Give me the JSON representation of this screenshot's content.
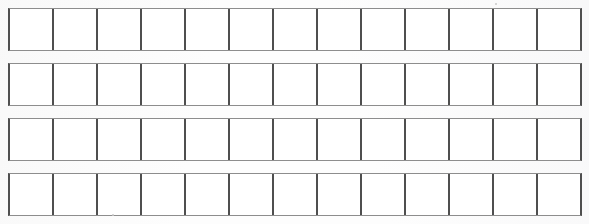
{
  "document": {
    "title": "Blank Grid Worksheet",
    "background_color": "#fdfdfd",
    "cell_fill_color": "#ffffff",
    "vertical_line_color": "#4f4f4f",
    "horizontal_line_color": "#8d8d8d"
  },
  "grid": {
    "row_count": 4,
    "columns_per_row": 13,
    "left_px": 8,
    "right_px": 582,
    "cell_width_px": 44,
    "row_height_px": 43,
    "row_gap_px": 13,
    "rows": [
      {
        "index": 1,
        "label": "row-1",
        "top_px": 8,
        "cells": [
          "",
          "",
          "",
          "",
          "",
          "",
          "",
          "",
          "",
          "",
          "",
          "",
          ""
        ]
      },
      {
        "index": 2,
        "label": "row-2",
        "top_px": 63,
        "cells": [
          "",
          "",
          "",
          "",
          "",
          "",
          "",
          "",
          "",
          "",
          "",
          "",
          ""
        ]
      },
      {
        "index": 3,
        "label": "row-3",
        "top_px": 118,
        "cells": [
          "",
          "",
          "",
          "",
          "",
          "",
          "",
          "",
          "",
          "",
          "",
          "",
          ""
        ]
      },
      {
        "index": 4,
        "label": "row-4",
        "top_px": 173,
        "cells": [
          "",
          "",
          "",
          "",
          "",
          "",
          "",
          "",
          "",
          "",
          "",
          "",
          ""
        ]
      }
    ]
  },
  "artifacts": {
    "specks": [
      {
        "x_px": 495,
        "y_px": 3,
        "size_px": 2
      },
      {
        "x_px": 112,
        "y_px": 214,
        "size_px": 2
      }
    ]
  }
}
